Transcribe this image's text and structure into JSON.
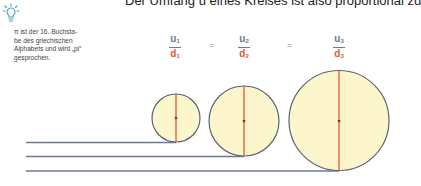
{
  "heading": "Der Umfang u eines Kreises ist also proportional zu",
  "tip": {
    "icon": "lightbulb-icon",
    "text": "π ist der 16. Buchsta-be des griechischen Alphabets und wird „pi“ gesprochen.",
    "lines": [
      "π ist der 16. Buchsta-",
      "be des griechischen",
      "Alphabets und wird „pi“",
      "gesprochen."
    ]
  },
  "equation": {
    "fractions": [
      {
        "num": "u",
        "num_sub": "1",
        "den": "d",
        "den_sub": "1"
      },
      {
        "num": "u",
        "num_sub": "2",
        "den": "d",
        "den_sub": "2"
      },
      {
        "num": "u",
        "num_sub": "3",
        "den": "d",
        "den_sub": "3"
      }
    ],
    "operator": "="
  },
  "circles": [
    {
      "label": "circle-1",
      "cx": 176,
      "cy": 118,
      "r": 24
    },
    {
      "label": "circle-2",
      "cx": 244,
      "cy": 121,
      "r": 35
    },
    {
      "label": "circle-3",
      "cx": 339,
      "cy": 120,
      "r": 50
    }
  ],
  "colors": {
    "circle_fill": "#fdf6cc",
    "circle_stroke": "#5a6470",
    "diameter": "#e05a35",
    "baseline": "#6b7a99",
    "numerator": "#6b7a99",
    "denominator": "#e05a35",
    "icon": "#4aa3c8"
  }
}
